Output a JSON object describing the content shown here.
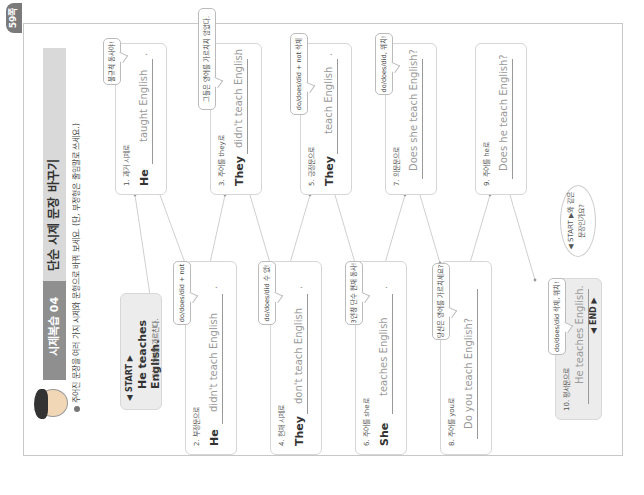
{
  "page": {
    "page_tab": "59쪽",
    "lesson_number": "시제복습 04",
    "lesson_title": "단순 시제 문장 바꾸기",
    "instruction": "주어진 문장을 여러 가지 시제와 문형으로 바꿔 보세요. (단, 부정형은 줄임말로 쓰세요.)"
  },
  "start": {
    "label": "◀ START ▶",
    "sentence": "He teaches English.",
    "translation": "그는 영어를 가르친다."
  },
  "steps": [
    {
      "label": "1. 과거 시제로",
      "subject": "He",
      "answer": "taught English",
      "end": ".",
      "hint": "불규칙 동사야!"
    },
    {
      "label": "2. 부정문으로",
      "subject": "He",
      "answer": "didn't teach English",
      "end": ".",
      "hint": "do/does/did + not"
    },
    {
      "label": "3. 주어를 they로",
      "subject": "They",
      "answer": "didn't teach English",
      "end": ".",
      "hint": "그들은 영어를 가르치지 않았다."
    },
    {
      "label": "4. 현재 시제로",
      "subject": "They",
      "answer": "don't teach English",
      "end": ".",
      "hint": "do/does/did 수 있!"
    },
    {
      "label": "5. 긍정문으로",
      "subject": "They",
      "answer": "teach English",
      "end": ".",
      "hint": "do/does/did + not 삭제"
    },
    {
      "label": "6. 주어를 she로",
      "subject": "She",
      "answer": "teaches English",
      "end": ".",
      "hint": "3인칭 단수 현재 동사!"
    },
    {
      "label": "7. 의문문으로",
      "subject": "",
      "answer": "Does she teach English?",
      "end": "",
      "hint": "do/does/did, 위치!"
    },
    {
      "label": "8. 주어를 you로",
      "subject": "",
      "answer": "Do you teach English?",
      "end": "",
      "hint": "당신은 영어를 가르치세요?"
    },
    {
      "label": "9. 주어를 he로",
      "subject": "",
      "answer": "Does he teach English?",
      "end": "",
      "hint": ""
    },
    {
      "label": "10. 평서문으로",
      "subject": "",
      "answer": "He teaches English.",
      "end": "",
      "hint": "do/does/did 삭제, 위치!"
    }
  ],
  "end": {
    "label": "◀ END ▶",
    "check_bubble": "◀ START ▶와 같은 문장인가요?"
  }
}
